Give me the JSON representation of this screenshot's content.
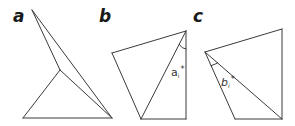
{
  "figure": {
    "panels": [
      {
        "id": "a",
        "label": "a",
        "label_pos": [
          13,
          22
        ],
        "edges": [
          [
            [
              32,
              10
            ],
            [
              60,
              70
            ]
          ],
          [
            [
              32,
              10
            ],
            [
              112,
              118
            ]
          ],
          [
            [
              60,
              70
            ],
            [
              23,
              118
            ]
          ],
          [
            [
              60,
              70
            ],
            [
              112,
              118
            ]
          ],
          [
            [
              23,
              118
            ],
            [
              112,
              118
            ]
          ]
        ]
      },
      {
        "id": "b",
        "label": "b",
        "label_pos": [
          99,
          22
        ],
        "edges": [
          [
            [
              112,
              53
            ],
            [
              186,
              31
            ]
          ],
          [
            [
              186,
              31
            ],
            [
              186,
              119
            ]
          ],
          [
            [
              186,
              119
            ],
            [
              141,
              119
            ]
          ],
          [
            [
              141,
              119
            ],
            [
              112,
              53
            ]
          ],
          [
            [
              141,
              119
            ],
            [
              186,
              31
            ]
          ]
        ],
        "angle": {
          "vertex": [
            186,
            31
          ],
          "arc_path": "M 179.2 44.3 Q 182 49 186 49",
          "label_base": "a",
          "label_sub": "i",
          "label_sup": "*",
          "label_pos": [
            171,
            76
          ]
        }
      },
      {
        "id": "c",
        "label": "c",
        "label_pos": [
          193,
          22
        ],
        "edges": [
          [
            [
              205,
              52
            ],
            [
              282,
              29
            ]
          ],
          [
            [
              282,
              29
            ],
            [
              282,
              119
            ]
          ],
          [
            [
              282,
              119
            ],
            [
              235,
              119
            ]
          ],
          [
            [
              235,
              119
            ],
            [
              205,
              52
            ]
          ],
          [
            [
              205,
              52
            ],
            [
              282,
              119
            ]
          ]
        ],
        "angle": {
          "vertex": [
            205,
            52
          ],
          "arc_path": "M 211.1 65.7 Q 216 64 217.5 62.9",
          "label_base": "b",
          "label_sub": "i",
          "label_sup": "*",
          "label_pos": [
            221,
            86
          ]
        }
      }
    ]
  }
}
